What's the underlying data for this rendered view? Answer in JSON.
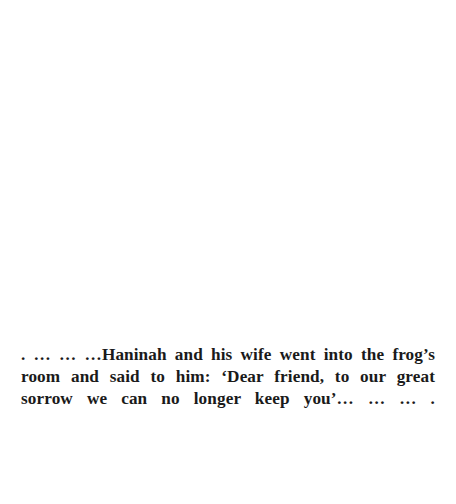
{
  "page": {
    "background_color": "#ffffff",
    "width": 456,
    "height": 504
  },
  "excerpt": {
    "text_color": "#1a1a1a",
    "alignment": "justified",
    "full_text": ". … … …Haninah and his wife went into the frog’s room and said to him: ‘Dear friend, to our great sorrow we can no longer keep you’… … … .",
    "lines": [
      ". … … …Haninah and his wife went into the",
      "frog’s room and said to him: ‘Dear friend, to",
      "our great sorrow we can no longer keep you’…",
      "… … ."
    ]
  }
}
